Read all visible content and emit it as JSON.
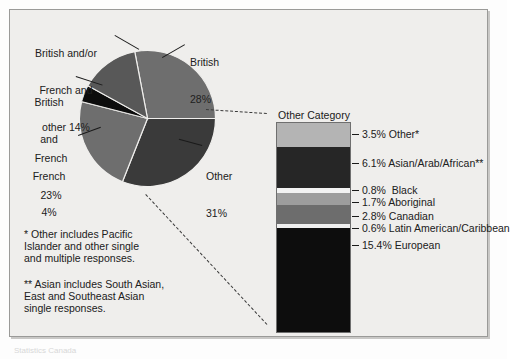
{
  "chart_data": {
    "type": "pie",
    "title": "",
    "pie": {
      "categories": [
        "British",
        "Other",
        "French",
        "British and French",
        "British and/or French and other"
      ],
      "values": [
        28,
        31,
        23,
        4,
        14
      ],
      "unit": "%",
      "labels": [
        {
          "name": "British",
          "value": "28%",
          "text_line1": "British",
          "text_line2": "28%"
        },
        {
          "name": "Other",
          "value": "31%",
          "text_line1": "Other",
          "text_line2": "31%"
        },
        {
          "name": "French",
          "value": "23%",
          "text_line1": "French",
          "text_line2": "23%"
        },
        {
          "name": "British and French",
          "value": "4%",
          "text_line1": "British",
          "text_line2": "and",
          "text_line3": "French",
          "text_line4": "4%"
        },
        {
          "name": "British and/or French and other",
          "value": "14%",
          "text_line1": "British and/or",
          "text_line2": "French and",
          "text_line3": "other 14%"
        }
      ],
      "colors": [
        "#6e6e6e",
        "#3a3a3a",
        "#6e6e6e",
        "#0c0c0c",
        "#585858"
      ]
    },
    "breakout_bar": {
      "type": "bar",
      "heading_line1": "Other Category",
      "heading_line2": "31%",
      "total": 31,
      "categories": [
        "Other*",
        "Asian/Arab/African**",
        "Black",
        "Aboriginal",
        "Canadian",
        "Latin American/Caribbean",
        "European"
      ],
      "values": [
        3.5,
        6.1,
        0.8,
        1.7,
        2.8,
        0.6,
        15.4
      ],
      "labels": [
        "3.5% Other*",
        "6.1% Asian/Arab/African**",
        "0.8%  Black",
        "1.7% Aboriginal",
        "2.8% Canadian",
        "0.6% Latin American/Caribbean",
        "15.4% European"
      ],
      "colors": [
        "#b4b4b4",
        "#262626",
        "#f2f2f2",
        "#9d9d9d",
        "#6d6d6d",
        "#efefef",
        "#0d0d0d"
      ]
    },
    "footnotes": [
      "* Other includes Pacific\nIslander and other single\nand multiple responses.",
      "** Asian includes South Asian,\nEast and Southeast Asian\nsingle responses."
    ],
    "legend_position": "inline-labels",
    "grid": false
  },
  "frame": {
    "border_color": "#9a9a98",
    "background": "#efeeec"
  },
  "credit": {
    "text": "Statistics Canada"
  }
}
